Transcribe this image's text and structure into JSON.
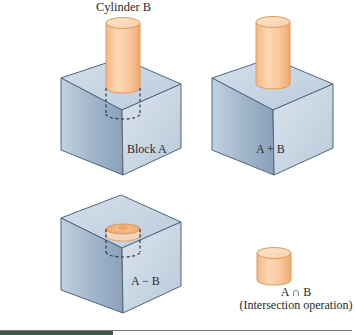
{
  "figure": {
    "labels": {
      "cylinder_b": "Cylinder B",
      "block_a": "Block A",
      "union": "A + B",
      "difference": "A − B",
      "intersection_symbol": "A ∩ B",
      "intersection_caption": "(Intersection operation)"
    },
    "panels": [
      {
        "id": "original",
        "description": "Cylinder B inserted into Block A (hidden portion dashed)",
        "label_key": "block_a"
      },
      {
        "id": "union",
        "description": "Union of block and cylinder",
        "label_key": "union"
      },
      {
        "id": "difference",
        "description": "Block with cylindrical hole removed",
        "label_key": "difference"
      },
      {
        "id": "intersection",
        "description": "Short cylinder common to both solids",
        "label_key": "intersection_symbol"
      }
    ],
    "colors": {
      "block_face_light": "#c9d6e3",
      "block_face_mid": "#a9bccf",
      "block_face_dark": "#8ea5bd",
      "block_edge": "#4d6780",
      "cylinder_light": "#fbd9b3",
      "cylinder_mid": "#f5b987",
      "cylinder_edge": "#e09a5c",
      "footer_dark": "#3e5a45"
    }
  }
}
